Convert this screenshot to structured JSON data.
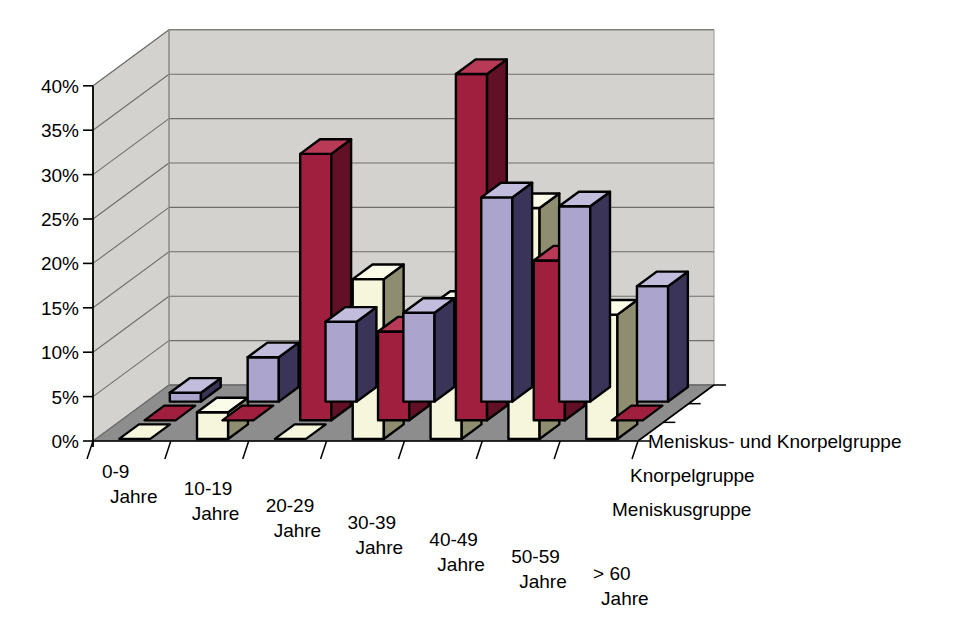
{
  "chart_data": {
    "type": "bar",
    "subtype": "3d-grouped-bar",
    "title": "",
    "subtitle": "",
    "xlabel": "",
    "ylabel": "",
    "categories": [
      "0-9 Jahre",
      "10-19 Jahre",
      "20-29 Jahre",
      "30-39 Jahre",
      "40-49 Jahre",
      "50-59 Jahre",
      "> 60 Jahre"
    ],
    "category_lines": [
      [
        "0-9",
        "Jahre"
      ],
      [
        "10-19",
        "Jahre"
      ],
      [
        "20-29",
        "Jahre"
      ],
      [
        "30-39",
        "Jahre"
      ],
      [
        "40-49",
        "Jahre"
      ],
      [
        "50-59",
        "Jahre"
      ],
      [
        "> 60",
        "Jahre"
      ]
    ],
    "series": [
      {
        "name": "Meniskusgruppe",
        "color": "#aba4cd",
        "side_color": "#3a3459",
        "top_color": "#c2bcdd",
        "values": [
          1,
          5,
          9,
          10,
          23,
          22,
          13
        ]
      },
      {
        "name": "Knorpelgruppe",
        "color": "#a01f3f",
        "side_color": "#611026",
        "top_color": "#b93a57",
        "values": [
          0,
          0,
          30,
          10,
          39,
          18,
          0
        ]
      },
      {
        "name": "Meniskus- und Knorpelgruppe",
        "color": "#f6f6dc",
        "side_color": "#8e8d70",
        "top_color": "#fbfbe9",
        "values": [
          0,
          3,
          0,
          18,
          15,
          26,
          14
        ]
      }
    ],
    "ytick_labels": [
      "0%",
      "5%",
      "10%",
      "15%",
      "20%",
      "25%",
      "30%",
      "35%",
      "40%"
    ],
    "ytick_values": [
      0,
      5,
      10,
      15,
      20,
      25,
      30,
      35,
      40
    ],
    "ylim": [
      0,
      40
    ],
    "grid": true,
    "legend_position": "right-inline-axis",
    "wall_color": "#d4d2ce",
    "floor_color": "#8d8d8d",
    "gridline_color": "#6e6e6e",
    "outline_color": "#000000"
  },
  "legend": {
    "items": [
      "Meniskus- und Knorpelgruppe",
      "Knorpelgruppe",
      "Meniskusgruppe"
    ]
  }
}
